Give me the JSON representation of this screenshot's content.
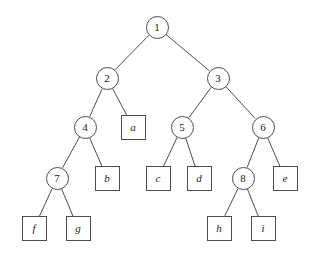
{
  "figure": {
    "name": "binary-tree-diagram",
    "background_color": "#ffffff",
    "stroke_color": "#4d4d4d",
    "text_color": "#1a1a1a",
    "width": 317,
    "height": 257
  },
  "nodes": [
    {
      "id": "n1",
      "label": "1",
      "shape": "circle",
      "x": 157,
      "y": 27
    },
    {
      "id": "n2",
      "label": "2",
      "shape": "circle",
      "x": 107,
      "y": 78
    },
    {
      "id": "n3",
      "label": "3",
      "shape": "circle",
      "x": 218,
      "y": 78
    },
    {
      "id": "n4",
      "label": "4",
      "shape": "circle",
      "x": 85,
      "y": 127
    },
    {
      "id": "na",
      "label": "a",
      "shape": "square",
      "x": 133,
      "y": 127
    },
    {
      "id": "n5",
      "label": "5",
      "shape": "circle",
      "x": 182,
      "y": 127
    },
    {
      "id": "n6",
      "label": "6",
      "shape": "circle",
      "x": 263,
      "y": 127
    },
    {
      "id": "n7",
      "label": "7",
      "shape": "circle",
      "x": 57,
      "y": 178
    },
    {
      "id": "nb",
      "label": "b",
      "shape": "square",
      "x": 107,
      "y": 178
    },
    {
      "id": "nc",
      "label": "c",
      "shape": "square",
      "x": 158,
      "y": 178
    },
    {
      "id": "nd",
      "label": "d",
      "shape": "square",
      "x": 199,
      "y": 178
    },
    {
      "id": "n8",
      "label": "8",
      "shape": "circle",
      "x": 243,
      "y": 178
    },
    {
      "id": "ne",
      "label": "e",
      "shape": "square",
      "x": 285,
      "y": 178
    },
    {
      "id": "nf",
      "label": "f",
      "shape": "square",
      "x": 34,
      "y": 228
    },
    {
      "id": "ng",
      "label": "g",
      "shape": "square",
      "x": 78,
      "y": 228
    },
    {
      "id": "nh",
      "label": "h",
      "shape": "square",
      "x": 219,
      "y": 228
    },
    {
      "id": "ni",
      "label": "i",
      "shape": "square",
      "x": 263,
      "y": 228
    }
  ],
  "edges": [
    {
      "from": "n1",
      "to": "n2"
    },
    {
      "from": "n1",
      "to": "n3"
    },
    {
      "from": "n2",
      "to": "n4"
    },
    {
      "from": "n2",
      "to": "na"
    },
    {
      "from": "n3",
      "to": "n5"
    },
    {
      "from": "n3",
      "to": "n6"
    },
    {
      "from": "n4",
      "to": "n7"
    },
    {
      "from": "n4",
      "to": "nb"
    },
    {
      "from": "n5",
      "to": "nc"
    },
    {
      "from": "n5",
      "to": "nd"
    },
    {
      "from": "n6",
      "to": "n8"
    },
    {
      "from": "n6",
      "to": "ne"
    },
    {
      "from": "n7",
      "to": "nf"
    },
    {
      "from": "n7",
      "to": "ng"
    },
    {
      "from": "n8",
      "to": "nh"
    },
    {
      "from": "n8",
      "to": "ni"
    }
  ]
}
